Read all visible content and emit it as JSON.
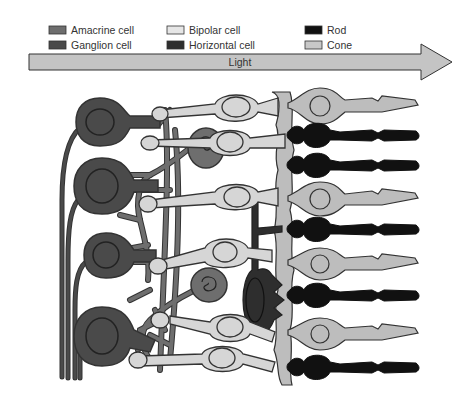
{
  "colors": {
    "amacrine": "#6e6e6e",
    "ganglion": "#4a4a4a",
    "bipolar": "#d6d6d6",
    "horizontal": "#2e2e2e",
    "rod": "#111111",
    "cone": "#bdbdbd",
    "outline": "#333333",
    "arrow_fill": "#c4c4c4"
  },
  "legend": [
    {
      "label": "Amacrine cell",
      "key": "amacrine"
    },
    {
      "label": "Ganglion cell",
      "key": "ganglion"
    },
    {
      "label": "Bipolar cell",
      "key": "bipolar"
    },
    {
      "label": "Horizontal cell",
      "key": "horizontal"
    },
    {
      "label": "Rod",
      "key": "rod"
    },
    {
      "label": "Cone",
      "key": "cone"
    }
  ],
  "arrow": {
    "label": "Light",
    "direction": "right"
  },
  "cells": {
    "ganglion": [
      {
        "cx": 100,
        "cy": 122,
        "r": 22
      },
      {
        "cx": 102,
        "cy": 186,
        "r": 27
      },
      {
        "cx": 106,
        "cy": 255,
        "r": 22
      },
      {
        "cx": 102,
        "cy": 336,
        "r": 28
      }
    ],
    "amacrine": [
      {
        "cx": 206,
        "cy": 148
      },
      {
        "cx": 209,
        "cy": 285
      }
    ],
    "horizontal": [
      {
        "cx": 254,
        "cy": 300
      }
    ],
    "bipolar": [
      {
        "cx": 236,
        "cy": 107
      },
      {
        "cx": 230,
        "cy": 142
      },
      {
        "cx": 237,
        "cy": 197
      },
      {
        "cx": 225,
        "cy": 252
      },
      {
        "cx": 230,
        "cy": 327
      },
      {
        "cx": 222,
        "cy": 358
      }
    ],
    "photoreceptors": [
      {
        "type": "cone",
        "y": 103
      },
      {
        "type": "rod",
        "y": 134
      },
      {
        "type": "rod",
        "y": 164
      },
      {
        "type": "cone",
        "y": 196
      },
      {
        "type": "rod",
        "y": 228
      },
      {
        "type": "cone",
        "y": 261
      },
      {
        "type": "rod",
        "y": 294
      },
      {
        "type": "cone",
        "y": 330
      },
      {
        "type": "rod",
        "y": 365
      }
    ]
  }
}
